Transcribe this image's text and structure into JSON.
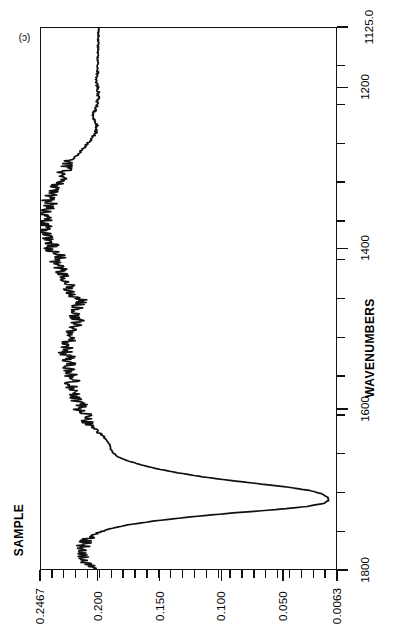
{
  "figure": {
    "panel_label": "(c)",
    "background": "#ffffff",
    "line_color": "#111111"
  },
  "axes": {
    "absorbance": {
      "title": "SAMPLE",
      "labels": [
        "0.2467",
        "0.200",
        "0.150",
        "0.100",
        "0.050",
        "0.0063"
      ],
      "values": [
        0.2467,
        0.2,
        0.15,
        0.1,
        0.05,
        0.0063
      ],
      "minor_ticks": 25
    },
    "wavenumbers": {
      "title": "WAVENUMBERS",
      "labels": [
        "1800",
        "1600",
        "1400",
        "1200",
        "1125.0"
      ],
      "values": [
        1800,
        1600,
        1400,
        1200,
        1125.0
      ],
      "minor_ticks": 14
    }
  },
  "chart_data": {
    "type": "line",
    "title": "",
    "subtitle": "",
    "xlabel": "WAVENUMBERS",
    "ylabel": "SAMPLE",
    "orientation": "rotated-90-ccw",
    "xlim": [
      1800,
      1125.0
    ],
    "ylim": [
      0.2467,
      0.0063
    ],
    "grid": false,
    "legend": null,
    "annotations": [
      {
        "text": "(c)",
        "position": "top-left-inside"
      }
    ],
    "x": [
      1800,
      1795,
      1790,
      1785,
      1780,
      1775,
      1770,
      1765,
      1760,
      1755,
      1750,
      1745,
      1740,
      1735,
      1730,
      1726,
      1722,
      1718,
      1714,
      1710,
      1706,
      1702,
      1698,
      1694,
      1690,
      1685,
      1680,
      1675,
      1670,
      1665,
      1660,
      1655,
      1650,
      1645,
      1640,
      1635,
      1630,
      1625,
      1620,
      1615,
      1610,
      1605,
      1600,
      1595,
      1590,
      1585,
      1580,
      1575,
      1570,
      1565,
      1560,
      1555,
      1550,
      1545,
      1540,
      1535,
      1530,
      1525,
      1520,
      1515,
      1510,
      1505,
      1500,
      1495,
      1490,
      1485,
      1480,
      1475,
      1470,
      1465,
      1460,
      1455,
      1450,
      1445,
      1440,
      1435,
      1430,
      1425,
      1420,
      1415,
      1410,
      1405,
      1400,
      1395,
      1390,
      1385,
      1380,
      1375,
      1370,
      1365,
      1360,
      1355,
      1350,
      1345,
      1340,
      1335,
      1330,
      1325,
      1320,
      1315,
      1310,
      1305,
      1300,
      1295,
      1290,
      1285,
      1280,
      1275,
      1270,
      1265,
      1260,
      1255,
      1250,
      1245,
      1240,
      1235,
      1230,
      1225,
      1220,
      1215,
      1210,
      1205,
      1200,
      1195,
      1190,
      1185,
      1180,
      1175,
      1170,
      1165,
      1160,
      1155,
      1150,
      1145,
      1140,
      1135,
      1130,
      1125
    ],
    "y": [
      0.2065,
      0.208,
      0.2095,
      0.211,
      0.212,
      0.2125,
      0.212,
      0.2105,
      0.207,
      0.201,
      0.191,
      0.176,
      0.154,
      0.125,
      0.09,
      0.056,
      0.03,
      0.016,
      0.012,
      0.0135,
      0.018,
      0.028,
      0.045,
      0.067,
      0.09,
      0.115,
      0.135,
      0.152,
      0.165,
      0.176,
      0.184,
      0.188,
      0.19,
      0.1905,
      0.193,
      0.196,
      0.1995,
      0.203,
      0.2075,
      0.21,
      0.208,
      0.212,
      0.216,
      0.214,
      0.218,
      0.22,
      0.2185,
      0.221,
      0.223,
      0.22,
      0.224,
      0.2215,
      0.225,
      0.223,
      0.226,
      0.224,
      0.227,
      0.225,
      0.2265,
      0.224,
      0.223,
      0.221,
      0.219,
      0.2175,
      0.2165,
      0.218,
      0.2195,
      0.2185,
      0.215,
      0.212,
      0.219,
      0.224,
      0.2255,
      0.2245,
      0.226,
      0.2275,
      0.229,
      0.231,
      0.233,
      0.2345,
      0.23,
      0.236,
      0.24,
      0.237,
      0.242,
      0.239,
      0.244,
      0.241,
      0.245,
      0.243,
      0.24,
      0.244,
      0.241,
      0.238,
      0.242,
      0.239,
      0.235,
      0.238,
      0.234,
      0.23,
      0.233,
      0.229,
      0.224,
      0.227,
      0.223,
      0.218,
      0.215,
      0.212,
      0.209,
      0.206,
      0.204,
      0.202,
      0.201,
      0.2015,
      0.203,
      0.204,
      0.2035,
      0.202,
      0.201,
      0.2005,
      0.2,
      0.2002,
      0.2005,
      0.201,
      0.2012,
      0.201,
      0.2008,
      0.2006,
      0.2005,
      0.2004,
      0.2003,
      0.2002,
      0.2002,
      0.2001,
      0.2001,
      0.2,
      0.2,
      0.2
    ],
    "peaks": [
      {
        "wavenumber": 1714,
        "absorbance": 0.012,
        "note": "strong carbonyl band"
      },
      {
        "wavenumber": 1271,
        "absorbance": 0.01,
        "note": "strong C-O band"
      },
      {
        "wavenumber": 1180,
        "absorbance": 0.067,
        "note": "fingerprint band"
      },
      {
        "wavenumber": 1150,
        "absorbance": 0.078,
        "note": "fingerprint band"
      },
      {
        "wavenumber": 1210,
        "absorbance": 0.062,
        "note": "fingerprint band"
      }
    ]
  }
}
